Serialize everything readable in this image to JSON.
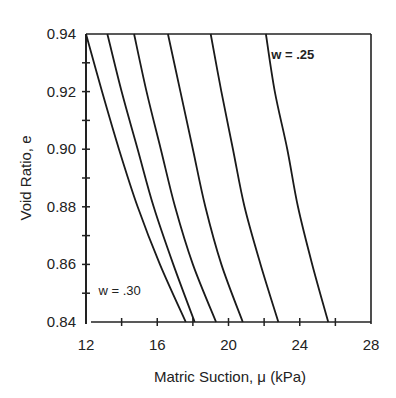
{
  "chart_data": {
    "type": "line",
    "title": "",
    "xlabel": "Matric Suction, μ (kPa)",
    "ylabel": "Void Ratio, e",
    "xlim": [
      12,
      28
    ],
    "ylim": [
      0.84,
      0.94
    ],
    "x_ticks": [
      12,
      16,
      20,
      24,
      28
    ],
    "x_tick_labels": [
      "12",
      "16",
      "20",
      "24",
      "28"
    ],
    "x_minor_ticks": [
      14,
      18,
      22,
      26
    ],
    "y_ticks": [
      0.84,
      0.86,
      0.88,
      0.9,
      0.92,
      0.94
    ],
    "y_tick_labels": [
      "0.84",
      "0.86",
      "0.88",
      "0.90",
      "0.92",
      "0.94"
    ],
    "y_minor_ticks": [
      0.85,
      0.87,
      0.89,
      0.91,
      0.93
    ],
    "grid": false,
    "legend": null,
    "annotations": [
      {
        "text": "w = .25",
        "x": 22.4,
        "y": 0.937,
        "bold": true
      },
      {
        "text": "w = .30",
        "x": 12.7,
        "y": 0.855,
        "bold": false
      }
    ],
    "series": [
      {
        "name": "w = .30",
        "x": [
          12.0,
          12.9,
          13.85,
          14.9,
          16.15,
          17.6
        ],
        "y": [
          0.94,
          0.92,
          0.9,
          0.88,
          0.86,
          0.84
        ]
      },
      {
        "name": "curve 2",
        "x": [
          13.2,
          14.0,
          14.9,
          15.8,
          16.9,
          18.1
        ],
        "y": [
          0.94,
          0.92,
          0.9,
          0.88,
          0.86,
          0.84
        ]
      },
      {
        "name": "curve 3",
        "x": [
          14.7,
          15.4,
          16.2,
          17.0,
          18.0,
          19.3
        ],
        "y": [
          0.94,
          0.92,
          0.9,
          0.88,
          0.86,
          0.84
        ]
      },
      {
        "name": "curve 4",
        "x": [
          16.6,
          17.3,
          18.0,
          18.7,
          19.6,
          20.8
        ],
        "y": [
          0.94,
          0.92,
          0.9,
          0.88,
          0.86,
          0.84
        ]
      },
      {
        "name": "curve 5",
        "x": [
          19.0,
          19.6,
          20.25,
          20.9,
          21.8,
          22.8
        ],
        "y": [
          0.94,
          0.92,
          0.9,
          0.88,
          0.86,
          0.84
        ]
      },
      {
        "name": "w = .25",
        "x": [
          22.1,
          22.6,
          23.3,
          23.9,
          24.7,
          25.6
        ],
        "y": [
          0.94,
          0.92,
          0.9,
          0.88,
          0.86,
          0.84
        ]
      }
    ]
  },
  "style": {
    "line_color": "#1a1a1a",
    "axis_color": "#222222"
  }
}
